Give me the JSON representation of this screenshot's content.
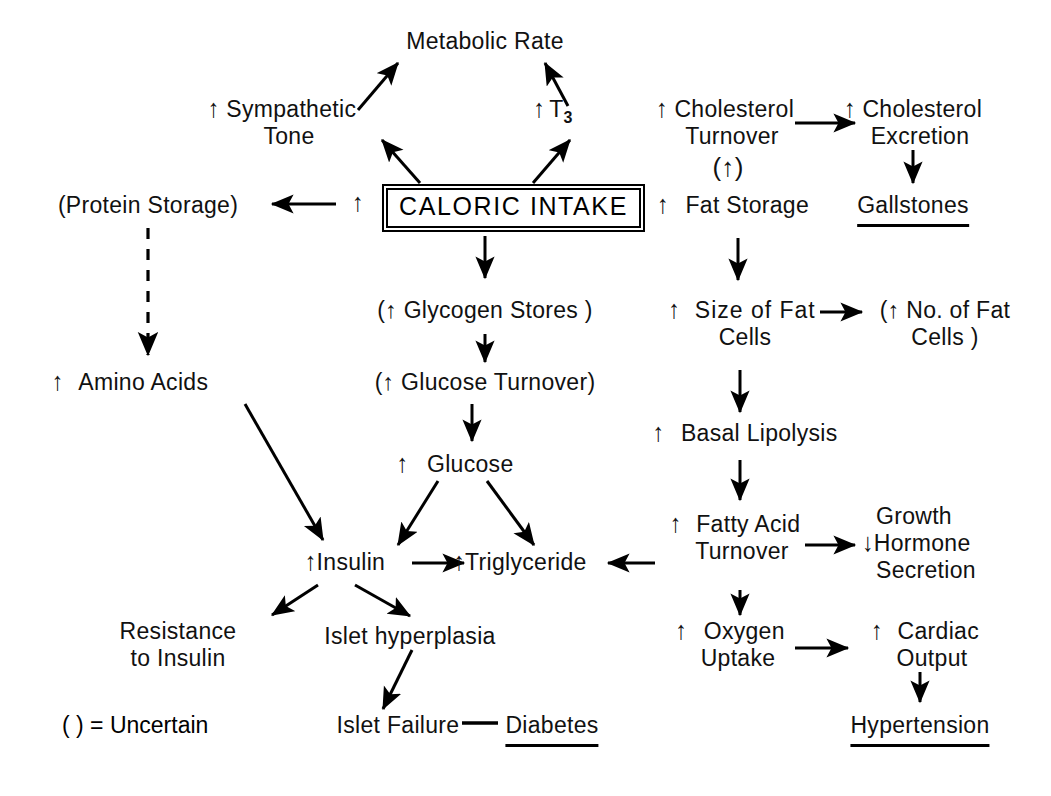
{
  "diagram": {
    "legend": {
      "text": "( ) = Uncertain"
    },
    "glyphs": {
      "up": "↑",
      "down": "↓",
      "dash": "—"
    },
    "nodes": [
      {
        "id": "metabolic-rate",
        "label": "Metabolic Rate",
        "arrow": "",
        "paren": false,
        "underline": false,
        "x": 485,
        "y": 42,
        "align": "center",
        "lines": [
          "Metabolic Rate"
        ]
      },
      {
        "id": "sympathetic-tone",
        "label": "Sympathetic Tone",
        "arrow": "up",
        "paren": false,
        "underline": false,
        "x": 282,
        "y": 114,
        "align": "center",
        "lines": [
          "Sympathetic",
          "Tone"
        ]
      },
      {
        "id": "t3",
        "label": "T3",
        "arrow": "up",
        "paren": false,
        "underline": false,
        "x": 553,
        "y": 114,
        "align": "center",
        "lines": [
          "T3"
        ]
      },
      {
        "id": "cholesterol-turnover",
        "label": "Cholesterol Turnover",
        "arrow": "up",
        "paren": false,
        "underline": false,
        "x": 725,
        "y": 114,
        "align": "center",
        "lines": [
          "Cholesterol",
          "Turnover"
        ]
      },
      {
        "id": "cholesterol-turnover-uncertain",
        "label": "(↑)",
        "arrow": "",
        "paren": false,
        "underline": false,
        "x": 728,
        "y": 160,
        "align": "center",
        "lines": [
          "(↑)"
        ]
      },
      {
        "id": "cholesterol-excretion",
        "label": "Cholesterol Excretion",
        "arrow": "up",
        "paren": false,
        "underline": false,
        "x": 913,
        "y": 114,
        "align": "center",
        "lines": [
          "Cholesterol",
          "Excretion"
        ]
      },
      {
        "id": "gallstones",
        "label": "Gallstones",
        "arrow": "",
        "paren": false,
        "underline": true,
        "x": 913,
        "y": 205,
        "align": "center",
        "lines": [
          "Gallstones"
        ]
      },
      {
        "id": "protein-storage",
        "label": "(Protein Storage)",
        "arrow": "",
        "paren": true,
        "underline": false,
        "x": 148,
        "y": 205,
        "align": "center",
        "lines": [
          "(Protein Storage)"
        ]
      },
      {
        "id": "caloric-intake",
        "label": "CALORIC INTAKE",
        "arrow": "",
        "paren": false,
        "underline": false,
        "x": 486,
        "y": 204,
        "align": "center",
        "lines": [
          "CALORIC INTAKE"
        ]
      },
      {
        "id": "fat-storage",
        "label": "Fat Storage",
        "arrow": "up",
        "paren": false,
        "underline": false,
        "x": 733,
        "y": 205,
        "align": "center",
        "lines": [
          "Fat Storage"
        ]
      },
      {
        "id": "glycogen-stores",
        "label": "(↑ Glycogen Stores )",
        "arrow": "",
        "paren": true,
        "underline": false,
        "x": 485,
        "y": 310,
        "align": "center",
        "lines": [
          "(↑ Glycogen Stores )"
        ]
      },
      {
        "id": "size-of-fat-cells",
        "label": "Size of Fat Cells",
        "arrow": "up",
        "paren": false,
        "underline": false,
        "x": 742,
        "y": 310,
        "align": "center",
        "lines": [
          "Size of Fat",
          "Cells"
        ]
      },
      {
        "id": "no-of-fat-cells",
        "label": "(↑ No. of Fat Cells )",
        "arrow": "",
        "paren": true,
        "underline": false,
        "x": 945,
        "y": 310,
        "align": "center",
        "lines": [
          "(↑ No. of  Fat",
          "Cells )"
        ]
      },
      {
        "id": "amino-acids",
        "label": "Amino Acids",
        "arrow": "up",
        "paren": false,
        "underline": false,
        "x": 130,
        "y": 382,
        "align": "center",
        "lines": [
          "Amino Acids"
        ]
      },
      {
        "id": "glucose-turnover",
        "label": "(↑ Glucose Turnover)",
        "arrow": "",
        "paren": true,
        "underline": false,
        "x": 485,
        "y": 382,
        "align": "center",
        "lines": [
          "(↑ Glucose Turnover)"
        ]
      },
      {
        "id": "basal-lipolysis",
        "label": "Basal Lipolysis",
        "arrow": "up",
        "paren": false,
        "underline": false,
        "x": 745,
        "y": 433,
        "align": "center",
        "lines": [
          "Basal Lipolysis"
        ]
      },
      {
        "id": "glucose",
        "label": "Glucose",
        "arrow": "up",
        "paren": false,
        "underline": false,
        "x": 455,
        "y": 464,
        "align": "center",
        "lines": [
          "Glucose"
        ]
      },
      {
        "id": "fatty-acid-turnover",
        "label": "Fatty Acid Turnover",
        "arrow": "up",
        "paren": false,
        "underline": false,
        "x": 735,
        "y": 524,
        "align": "center",
        "lines": [
          "Fatty Acid",
          "Turnover"
        ]
      },
      {
        "id": "growth-hormone-secretion",
        "label": "Growth Hormone Secretion",
        "arrow": "down",
        "paren": false,
        "underline": false,
        "x": 925,
        "y": 524,
        "align": "center",
        "lines": [
          "Growth",
          "Hormone",
          "Secretion"
        ]
      },
      {
        "id": "insulin",
        "label": "Insulin",
        "arrow": "up",
        "paren": false,
        "underline": false,
        "x": 345,
        "y": 562,
        "align": "center",
        "lines": [
          "Insulin"
        ]
      },
      {
        "id": "triglyceride",
        "label": "Triglyceride",
        "arrow": "up",
        "paren": false,
        "underline": false,
        "x": 520,
        "y": 562,
        "align": "center",
        "lines": [
          "Triglyceride"
        ]
      },
      {
        "id": "resistance-to-insulin",
        "label": "Resistance to Insulin",
        "arrow": "",
        "paren": false,
        "underline": false,
        "x": 178,
        "y": 632,
        "align": "center",
        "lines": [
          "Resistance",
          "to  Insulin"
        ]
      },
      {
        "id": "islet-hyperplasia",
        "label": "Islet hyperplasia",
        "arrow": "",
        "paren": false,
        "underline": false,
        "x": 410,
        "y": 637,
        "align": "center",
        "lines": [
          "Islet hyperplasia"
        ]
      },
      {
        "id": "oxygen-uptake",
        "label": "Oxygen Uptake",
        "arrow": "up",
        "paren": false,
        "underline": false,
        "x": 730,
        "y": 632,
        "align": "center",
        "lines": [
          "Oxygen",
          "Uptake"
        ]
      },
      {
        "id": "cardiac-output",
        "label": "Cardiac Output",
        "arrow": "up",
        "paren": false,
        "underline": false,
        "x": 925,
        "y": 632,
        "align": "center",
        "lines": [
          "Cardiac",
          "Output"
        ]
      },
      {
        "id": "islet-failure",
        "label": "Islet Failure",
        "arrow": "",
        "paren": false,
        "underline": false,
        "x": 398,
        "y": 727,
        "align": "center",
        "lines": [
          "Islet  Failure"
        ]
      },
      {
        "id": "diabetes",
        "label": "Diabetes",
        "arrow": "",
        "paren": false,
        "underline": true,
        "x": 552,
        "y": 727,
        "align": "center",
        "lines": [
          "Diabetes"
        ]
      },
      {
        "id": "hypertension",
        "label": "Hypertension",
        "arrow": "",
        "paren": false,
        "underline": true,
        "x": 920,
        "y": 727,
        "align": "center",
        "lines": [
          "Hypertension"
        ]
      }
    ],
    "edges": [
      {
        "id": "sympathetic-to-metabolic",
        "from": "sympathetic-tone",
        "to": "metabolic-rate",
        "style": "solid"
      },
      {
        "id": "t3-to-metabolic",
        "from": "t3",
        "to": "metabolic-rate",
        "style": "solid"
      },
      {
        "id": "caloric-to-sympathetic",
        "from": "caloric-intake",
        "to": "sympathetic-tone",
        "style": "solid"
      },
      {
        "id": "caloric-to-t3",
        "from": "caloric-intake",
        "to": "t3",
        "style": "solid"
      },
      {
        "id": "caloric-to-protein-storage",
        "from": "caloric-intake",
        "to": "protein-storage",
        "style": "solid"
      },
      {
        "id": "caloric-to-fat-storage",
        "from": "caloric-intake",
        "to": "fat-storage",
        "style": "solid"
      },
      {
        "id": "caloric-to-glycogen",
        "from": "caloric-intake",
        "to": "glycogen-stores",
        "style": "solid"
      },
      {
        "id": "cholesterol-turnover-to-excretion",
        "from": "cholesterol-turnover",
        "to": "cholesterol-excretion",
        "style": "solid"
      },
      {
        "id": "excretion-to-gallstones",
        "from": "cholesterol-excretion",
        "to": "gallstones",
        "style": "solid"
      },
      {
        "id": "protein-storage-to-amino-acids",
        "from": "protein-storage",
        "to": "amino-acids",
        "style": "dashed"
      },
      {
        "id": "fat-storage-to-size-of-fat",
        "from": "fat-storage",
        "to": "size-of-fat-cells",
        "style": "solid"
      },
      {
        "id": "size-of-fat-to-no-of-fat",
        "from": "size-of-fat-cells",
        "to": "no-of-fat-cells",
        "style": "solid"
      },
      {
        "id": "glycogen-to-glucose-turnover",
        "from": "glycogen-stores",
        "to": "glucose-turnover",
        "style": "solid"
      },
      {
        "id": "size-of-fat-to-basal-lipolysis",
        "from": "size-of-fat-cells",
        "to": "basal-lipolysis",
        "style": "solid"
      },
      {
        "id": "glucose-turnover-to-glucose",
        "from": "glucose-turnover",
        "to": "glucose",
        "style": "solid"
      },
      {
        "id": "amino-acids-to-insulin",
        "from": "amino-acids",
        "to": "insulin",
        "style": "solid"
      },
      {
        "id": "basal-lipolysis-to-fatty-acid",
        "from": "basal-lipolysis",
        "to": "fatty-acid-turnover",
        "style": "solid"
      },
      {
        "id": "glucose-to-insulin",
        "from": "glucose",
        "to": "insulin",
        "style": "solid"
      },
      {
        "id": "glucose-to-triglyceride",
        "from": "glucose",
        "to": "triglyceride",
        "style": "solid"
      },
      {
        "id": "insulin-to-triglyceride",
        "from": "insulin",
        "to": "triglyceride",
        "style": "solid"
      },
      {
        "id": "turnover-to-triglyceride",
        "from": "fatty-acid-turnover",
        "to": "triglyceride",
        "style": "solid"
      },
      {
        "id": "turnover-to-growth-hormone",
        "from": "fatty-acid-turnover",
        "to": "growth-hormone-secretion",
        "style": "solid"
      },
      {
        "id": "insulin-to-resistance",
        "from": "insulin",
        "to": "resistance-to-insulin",
        "style": "solid"
      },
      {
        "id": "insulin-to-islet-hyperplasia",
        "from": "insulin",
        "to": "islet-hyperplasia",
        "style": "solid"
      },
      {
        "id": "turnover-to-oxygen-uptake",
        "from": "fatty-acid-turnover",
        "to": "oxygen-uptake",
        "style": "solid"
      },
      {
        "id": "islet-hyperplasia-to-failure",
        "from": "islet-hyperplasia",
        "to": "islet-failure",
        "style": "solid"
      },
      {
        "id": "oxygen-uptake-to-cardiac",
        "from": "oxygen-uptake",
        "to": "cardiac-output",
        "style": "solid"
      },
      {
        "id": "cardiac-to-hypertension",
        "from": "cardiac-output",
        "to": "hypertension",
        "style": "solid"
      },
      {
        "id": "islet-failure-to-diabetes",
        "from": "islet-failure",
        "to": "diabetes",
        "style": "line"
      }
    ]
  }
}
